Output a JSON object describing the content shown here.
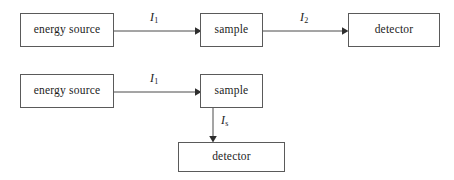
{
  "diagram": {
    "background_color": "#ffffff",
    "border_color": "#5a5a5a",
    "line_color": "#4a4a4a",
    "text_color": "#1c1c1c",
    "rows": [
      {
        "name": "transmission-row",
        "nodes": [
          {
            "id": "source-1",
            "label": "energy source"
          },
          {
            "id": "sample-1",
            "label": "sample"
          },
          {
            "id": "detector-1",
            "label": "detector"
          }
        ],
        "edges": [
          {
            "id": "edge-source1-sample1",
            "label_symbol": "I",
            "label_subscript": "1"
          },
          {
            "id": "edge-sample1-detector1",
            "label_symbol": "I",
            "label_subscript": "2"
          }
        ]
      },
      {
        "name": "scattering-row",
        "nodes": [
          {
            "id": "source-2",
            "label": "energy source"
          },
          {
            "id": "sample-2",
            "label": "sample"
          },
          {
            "id": "detector-2",
            "label": "detector"
          }
        ],
        "edges": [
          {
            "id": "edge-source2-sample2",
            "label_symbol": "I",
            "label_subscript": "1"
          },
          {
            "id": "edge-sample2-detector2",
            "label_symbol": "I",
            "label_subscript": "s"
          }
        ]
      }
    ]
  }
}
